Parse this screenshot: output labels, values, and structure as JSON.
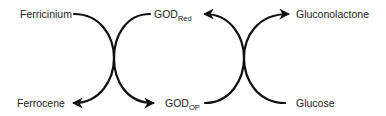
{
  "diagram": {
    "type": "coupled-redox-cycle",
    "labels": {
      "ferricinium": "Ferricinium",
      "ferrocene": "Ferrocene",
      "god_red_main": "GOD",
      "god_red_sub": "Red",
      "god_ox_main": "GOD",
      "god_ox_sub": "OP",
      "gluconolactone": "Gluconolactone",
      "glucose": "Glucose"
    },
    "colors": {
      "line": "#111111",
      "text": "#222222",
      "background": "#ffffff"
    },
    "edges": [
      {
        "from": "Ferricinium",
        "to": "Ferrocene",
        "arrow": "end"
      },
      {
        "from": "GOD Red",
        "to": "GOD OP",
        "arrow": "end"
      },
      {
        "from": "GOD OP",
        "to": "GOD Red",
        "arrow": "end"
      },
      {
        "from": "Glucose",
        "to": "Gluconolactone",
        "arrow": "end"
      }
    ]
  }
}
